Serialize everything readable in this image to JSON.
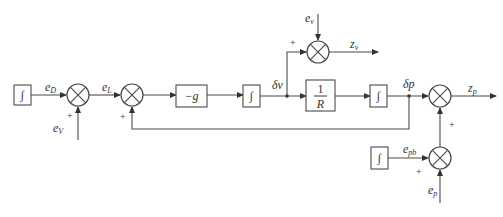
{
  "diagram": {
    "type": "block-diagram",
    "blocks": {
      "int1": "∫",
      "gain_g": "−g",
      "int2": "∫",
      "recip_num": "1",
      "recip_den": "R",
      "int3": "∫",
      "int4": "∫"
    },
    "signals": {
      "eD": {
        "base": "e",
        "sub": "D"
      },
      "eV": {
        "base": "e",
        "sub": "V"
      },
      "eL": {
        "base": "e",
        "sub": "L"
      },
      "ev": {
        "base": "e",
        "sub": "v"
      },
      "zv": {
        "base": "z",
        "sub": "v"
      },
      "dv": "δv",
      "dp": "δp",
      "zp": {
        "base": "z",
        "sub": "p"
      },
      "epb": {
        "base": "e",
        "sub": "pb"
      },
      "ep": {
        "base": "e",
        "sub": "p"
      }
    },
    "signs": {
      "plus": "+"
    }
  }
}
